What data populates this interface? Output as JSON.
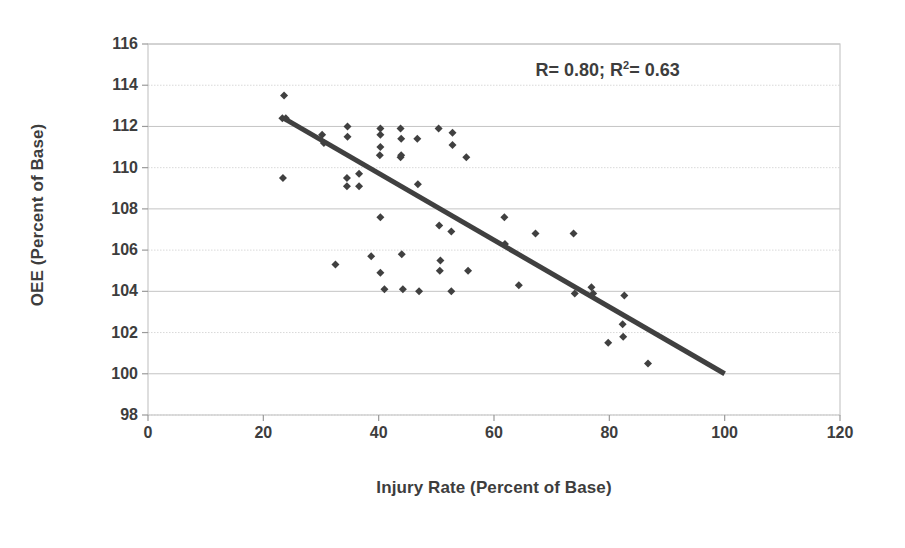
{
  "chart_data": {
    "type": "scatter",
    "title": "",
    "xlabel": "Injury Rate (Percent of Base)",
    "ylabel": "OEE (Percent of Base)",
    "xlim": [
      0,
      120
    ],
    "ylim": [
      98,
      116
    ],
    "xticks": [
      0,
      20,
      40,
      60,
      80,
      100,
      120
    ],
    "yticks": [
      98,
      100,
      102,
      104,
      106,
      108,
      110,
      112,
      114,
      116
    ],
    "grid": true,
    "legend": "none",
    "annotations": [
      {
        "text": "R= 0.80; R²= 0.63",
        "text_prefix": "R= 0.80; R",
        "text_sup": "2",
        "text_suffix": "= 0.63",
        "x": 88,
        "y": 114.6
      }
    ],
    "series": [
      {
        "name": "OEE vs Injury Rate",
        "marker": "diamond",
        "color": "#404040",
        "points": [
          [
            23.6,
            113.5
          ],
          [
            23.3,
            112.4
          ],
          [
            23.9,
            112.4
          ],
          [
            23.4,
            109.5
          ],
          [
            30.2,
            111.6
          ],
          [
            30.5,
            111.2
          ],
          [
            32.5,
            105.3
          ],
          [
            34.6,
            112.0
          ],
          [
            34.6,
            111.5
          ],
          [
            34.5,
            109.5
          ],
          [
            34.5,
            109.1
          ],
          [
            36.6,
            109.7
          ],
          [
            36.6,
            109.1
          ],
          [
            38.7,
            105.7
          ],
          [
            40.3,
            111.9
          ],
          [
            40.3,
            111.6
          ],
          [
            40.3,
            111.0
          ],
          [
            40.2,
            110.6
          ],
          [
            40.3,
            107.6
          ],
          [
            40.3,
            104.9
          ],
          [
            41.0,
            104.1
          ],
          [
            43.8,
            111.9
          ],
          [
            43.9,
            111.4
          ],
          [
            43.9,
            110.6
          ],
          [
            43.8,
            110.5
          ],
          [
            44.0,
            105.8
          ],
          [
            44.2,
            104.1
          ],
          [
            46.7,
            111.4
          ],
          [
            46.8,
            109.2
          ],
          [
            47.0,
            104.0
          ],
          [
            50.4,
            111.9
          ],
          [
            50.5,
            107.2
          ],
          [
            50.7,
            105.5
          ],
          [
            50.6,
            105.0
          ],
          [
            52.8,
            111.7
          ],
          [
            52.8,
            111.1
          ],
          [
            52.6,
            106.9
          ],
          [
            52.6,
            104.0
          ],
          [
            55.2,
            110.5
          ],
          [
            55.5,
            105.0
          ],
          [
            61.8,
            107.6
          ],
          [
            61.9,
            106.3
          ],
          [
            64.3,
            104.3
          ],
          [
            67.2,
            106.8
          ],
          [
            73.8,
            106.8
          ],
          [
            74.0,
            103.9
          ],
          [
            76.9,
            104.2
          ],
          [
            77.2,
            103.9
          ],
          [
            79.8,
            101.5
          ],
          [
            82.4,
            101.8
          ],
          [
            82.6,
            103.8
          ],
          [
            82.3,
            102.4
          ],
          [
            86.7,
            100.5
          ]
        ]
      }
    ],
    "trendline": {
      "name": "linear-fit",
      "color": "#404040",
      "x0": 23.5,
      "y0": 112.4,
      "x1": 100.0,
      "y1": 100.0
    }
  }
}
